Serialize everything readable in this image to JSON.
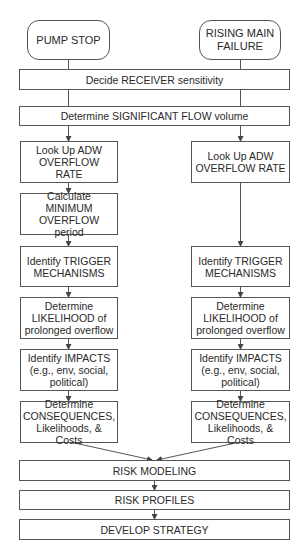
{
  "diagram": {
    "start_nodes": {
      "pump_stop": "PUMP STOP",
      "rising_main": "RISING MAIN\nFAILURE"
    },
    "shared_steps": {
      "receiver": "Decide RECEIVER sensitivity",
      "significant_flow": "Determine SIGNIFICANT FLOW volume"
    },
    "left_branch": {
      "adw_rate": "Look Up ADW\nOVERFLOW RATE",
      "min_overflow": "Calculate MINIMUM\nOVERFLOW period",
      "trigger": "Identify TRIGGER\nMECHANISMS",
      "likelihood": "Determine\nLIKELIHOOD of\nprolonged overflow",
      "impacts": "Identify IMPACTS\n(e.g., env, social,\npolitical)",
      "consequences": "Determine\nCONSEQUENCES,\nLikelihoods, & Costs"
    },
    "right_branch": {
      "adw_rate": "Look Up ADW\nOVERFLOW RATE",
      "trigger": "Identify TRIGGER\nMECHANISMS",
      "likelihood": "Determine\nLIKELIHOOD of\nprolonged overflow",
      "impacts": "Identify IMPACTS\n(e.g., env, social,\npolitical)",
      "consequences": "Determine\nCONSEQUENCES,\nLikelihoods, & Costs"
    },
    "final_steps": {
      "risk_modeling": "RISK MODELING",
      "risk_profiles": "RISK PROFILES",
      "develop_strategy": "DEVELOP STRATEGY"
    },
    "colors": {
      "line": "#555555",
      "box_fill": "#ffffff",
      "text": "#2a2a2a"
    }
  }
}
